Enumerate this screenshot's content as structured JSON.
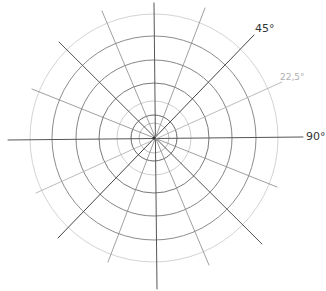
{
  "diagram": {
    "type": "polar-grid",
    "style": "hand-drawn pencil",
    "center": [
      154,
      138
    ],
    "rings": [
      {
        "r": 15,
        "color": "#9a9a9a",
        "width": 0.7
      },
      {
        "r": 23,
        "color": "#555555",
        "width": 0.9
      },
      {
        "r": 37,
        "color": "#c2c2c2",
        "width": 0.8
      },
      {
        "r": 55,
        "color": "#6a6a6a",
        "width": 0.9
      },
      {
        "r": 78,
        "color": "#777777",
        "width": 0.9
      },
      {
        "r": 102,
        "color": "#7f7f7f",
        "width": 0.9
      },
      {
        "r": 124,
        "color": "#c8c8c8",
        "width": 0.8
      }
    ],
    "spokes": [
      {
        "name": "vertical",
        "x1": 154,
        "y1": 3,
        "x2": 157,
        "y2": 289,
        "color": "#555555",
        "width": 1.0
      },
      {
        "name": "horizontal",
        "x1": 8,
        "y1": 140,
        "x2": 303,
        "y2": 137,
        "color": "#555555",
        "width": 1.0
      },
      {
        "name": "diag-45",
        "x1": 58,
        "y1": 238,
        "x2": 254,
        "y2": 35,
        "color": "#444444",
        "width": 1.0
      },
      {
        "name": "diag-135",
        "x1": 59,
        "y1": 42,
        "x2": 262,
        "y2": 244,
        "color": "#555555",
        "width": 1.0
      },
      {
        "name": "spoke-22-5",
        "x1": 36,
        "y1": 193,
        "x2": 282,
        "y2": 82,
        "color": "#aaaaaa",
        "width": 0.8
      },
      {
        "name": "spoke-157-5",
        "x1": 32,
        "y1": 89,
        "x2": 277,
        "y2": 187,
        "color": "#888888",
        "width": 0.8
      },
      {
        "name": "spoke-67-5",
        "x1": 102,
        "y1": 11,
        "x2": 209,
        "y2": 265,
        "color": "#888888",
        "width": 0.8
      },
      {
        "name": "spoke-112-5",
        "x1": 205,
        "y1": 8,
        "x2": 108,
        "y2": 262,
        "color": "#888888",
        "width": 0.8
      }
    ],
    "labels": [
      {
        "text": "45°",
        "x": 255,
        "y": 22,
        "color": "#333333",
        "size": 11
      },
      {
        "text": "22,5°",
        "x": 280,
        "y": 72,
        "color": "#b0b0b0",
        "size": 9
      },
      {
        "text": "90°",
        "x": 306,
        "y": 130,
        "color": "#333333",
        "size": 11
      }
    ]
  }
}
